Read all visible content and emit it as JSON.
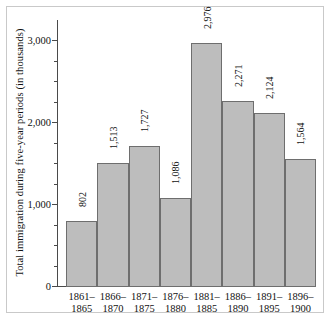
{
  "chart_data": {
    "type": "bar",
    "title": "",
    "xlabel": "",
    "ylabel": "Total immigration during five-year periods (in thousands)",
    "categories": [
      "1861–1865",
      "1866–1870",
      "1871–1875",
      "1876–1880",
      "1881–1885",
      "1886–1890",
      "1891–1895",
      "1896–1900"
    ],
    "category_lines": [
      [
        "1861–",
        "1865"
      ],
      [
        "1866–",
        "1870"
      ],
      [
        "1871–",
        "1875"
      ],
      [
        "1876–",
        "1880"
      ],
      [
        "1881–",
        "1885"
      ],
      [
        "1886–",
        "1890"
      ],
      [
        "1891–",
        "1895"
      ],
      [
        "1896–",
        "1900"
      ]
    ],
    "values": [
      802,
      1513,
      1727,
      1086,
      2976,
      2271,
      2124,
      1564
    ],
    "value_labels": [
      "802",
      "1,513",
      "1,727",
      "1,086",
      "2,976",
      "2,271",
      "2,124",
      "1,564"
    ],
    "ylim": [
      0,
      3250
    ],
    "y_major_ticks": [
      0,
      1000,
      2000,
      3000
    ],
    "y_major_tick_labels": [
      "0",
      "1,000",
      "2,000",
      "3,000"
    ],
    "y_minor_ticks": [
      250,
      500,
      750,
      1250,
      1500,
      1750,
      2250,
      2500,
      2750,
      3000
    ],
    "grid": false,
    "legend": "none",
    "bar_fill_color": "#bdbdbd",
    "bar_border_color": "#6e6e6e",
    "axis_color": "#4a4a4a",
    "text_color": "#121212",
    "background_color": "#ffffff",
    "frame_color": "#c9c9c9"
  }
}
